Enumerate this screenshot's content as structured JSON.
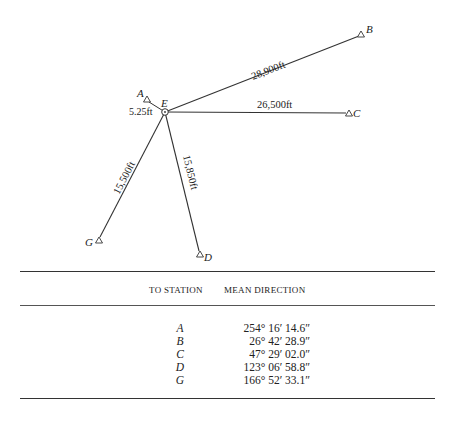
{
  "diagram": {
    "center_station": {
      "id": "E",
      "x": 165,
      "y": 112
    },
    "stations": [
      {
        "id": "A",
        "x": 147,
        "y": 100,
        "label_x": 139,
        "label_y": 99
      },
      {
        "id": "B",
        "x": 361,
        "y": 35,
        "label_x": 366,
        "label_y": 33
      },
      {
        "id": "C",
        "x": 349,
        "y": 113,
        "label_x": 354,
        "label_y": 117
      },
      {
        "id": "D",
        "x": 200,
        "y": 254,
        "label_x": 204,
        "label_y": 261
      },
      {
        "id": "G",
        "x": 99,
        "y": 240,
        "label_x": 86,
        "label_y": 245
      }
    ],
    "distances": {
      "A": "5.25ft",
      "B": "28,900ft",
      "C": "26,500ft",
      "D": "15,850ft",
      "G": "15,500ft"
    },
    "center_label": "E"
  },
  "table": {
    "headers": [
      "TO STATION",
      "MEAN DIRECTION"
    ],
    "rows": [
      {
        "station": "A",
        "direction": "254° 16′ 14.6″"
      },
      {
        "station": "B",
        "direction": "26° 42′ 28.9″"
      },
      {
        "station": "C",
        "direction": "47° 29′ 02.0″"
      },
      {
        "station": "D",
        "direction": "123° 06′ 58.8″"
      },
      {
        "station": "G",
        "direction": "166° 52′ 33.1″"
      }
    ]
  }
}
